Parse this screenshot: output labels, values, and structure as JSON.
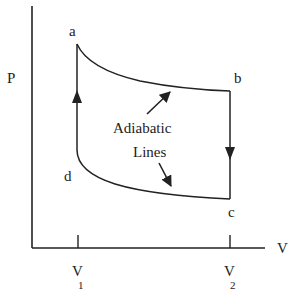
{
  "diagram": {
    "title": "",
    "type": "P-V cycle diagram",
    "colors": {
      "background": "#ffffff",
      "stroke": "#222222"
    },
    "axes": {
      "y_label": "P",
      "x_label": "V",
      "x_ticks": [
        {
          "main": "V",
          "sub": "1"
        },
        {
          "main": "V",
          "sub": "2"
        }
      ]
    },
    "points": [
      {
        "name": "a",
        "label": "a"
      },
      {
        "name": "b",
        "label": "b"
      },
      {
        "name": "c",
        "label": "c"
      },
      {
        "name": "d",
        "label": "d"
      }
    ],
    "annotation": {
      "line1": "Adiabatic",
      "line2": "Lines"
    },
    "edges": [
      {
        "from": "a",
        "to": "b",
        "kind": "adiabatic curve"
      },
      {
        "from": "b",
        "to": "c",
        "kind": "vertical line",
        "arrow": "down"
      },
      {
        "from": "c",
        "to": "d",
        "kind": "adiabatic curve"
      },
      {
        "from": "d",
        "to": "a",
        "kind": "vertical line",
        "arrow": "up"
      }
    ]
  }
}
